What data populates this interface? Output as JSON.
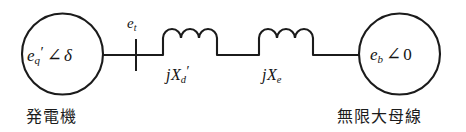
{
  "diagram": {
    "background_color": "#ffffff",
    "line_color": "#1b1b1b",
    "nodes": {
      "generator": {
        "icon": "circle-source-icon",
        "label_main": "e",
        "label_sub": "q",
        "label_prime": "′",
        "label_angle": "∠",
        "label_value": "δ",
        "caption": "発電機"
      },
      "infinite_bus": {
        "icon": "circle-source-icon",
        "label_main": "e",
        "label_sub": "b",
        "label_prime": "",
        "label_angle": "∠",
        "label_value": "0",
        "caption": "無限大母線"
      }
    },
    "terminal": {
      "label_main": "e",
      "label_sub": "t",
      "marker": "bus-tick-icon"
    },
    "branches": [
      {
        "name": "transient-reactance",
        "icon": "inductor-icon",
        "coil_humps": 3,
        "label_j": "j",
        "label_x": "X",
        "label_sub": "d",
        "label_prime": "′"
      },
      {
        "name": "external-reactance",
        "icon": "inductor-icon",
        "coil_humps": 3,
        "label_j": "j",
        "label_x": "X",
        "label_sub": "e",
        "label_prime": ""
      }
    ]
  }
}
